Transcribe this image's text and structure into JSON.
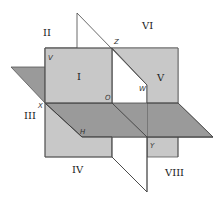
{
  "diagram": {
    "colors": {
      "vertical_plane": "#c8c8c8",
      "horizontal_plane": "#9a9a9a",
      "profile_plane": "#ffffff",
      "edge": "#444444",
      "background": "#ffffff"
    },
    "octant_labels": {
      "I": "I",
      "II": "II",
      "III": "III",
      "IV": "IV",
      "V": "V",
      "VI": "VI",
      "VIII": "VIII"
    },
    "point_labels": {
      "Z": "Z",
      "V": "V",
      "O": "O",
      "W": "W",
      "X": "X",
      "H": "H",
      "Y": "Y"
    }
  }
}
